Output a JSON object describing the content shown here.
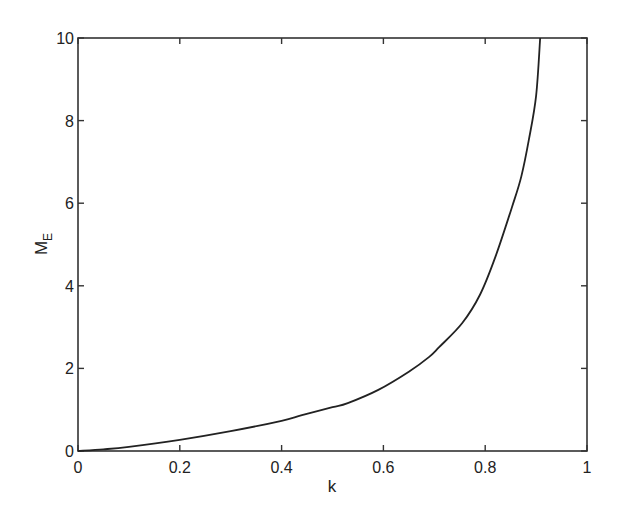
{
  "chart_data": {
    "type": "line",
    "title": "",
    "xlabel": "k",
    "ylabel": "M",
    "ylabel_subscript": "E",
    "xlim": [
      0,
      1
    ],
    "ylim": [
      0,
      10
    ],
    "grid": false,
    "legend": null,
    "xticks": [
      "0",
      "0.2",
      "0.4",
      "0.6",
      "0.8",
      "1"
    ],
    "xtick_values": [
      0,
      0.2,
      0.4,
      0.6,
      0.8,
      1
    ],
    "yticks": [
      "0",
      "2",
      "4",
      "6",
      "8",
      "10"
    ],
    "ytick_values": [
      0,
      2,
      4,
      6,
      8,
      10
    ],
    "series": [
      {
        "name": "M_E",
        "color": "#222222",
        "x": [
          0,
          0.05,
          0.1,
          0.2,
          0.3,
          0.4,
          0.44,
          0.5,
          0.53,
          0.59,
          0.65,
          0.69,
          0.71,
          0.755,
          0.79,
          0.82,
          0.853,
          0.871,
          0.886,
          0.9,
          0.908
        ],
        "y": [
          0,
          0.04,
          0.1,
          0.27,
          0.48,
          0.73,
          0.87,
          1.06,
          1.16,
          1.48,
          1.92,
          2.28,
          2.52,
          3.1,
          3.79,
          4.7,
          5.92,
          6.65,
          7.55,
          8.6,
          10
        ]
      }
    ]
  }
}
